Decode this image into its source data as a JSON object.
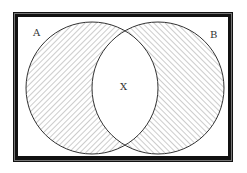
{
  "diagram": {
    "type": "venn",
    "title": "",
    "sets": [
      {
        "id": "A",
        "label": "A",
        "shaded": true,
        "hatch": "forward-diagonal"
      },
      {
        "id": "B",
        "label": "B",
        "shaded": true,
        "hatch": "back-diagonal"
      }
    ],
    "intersection": {
      "label": "X",
      "shaded": false
    },
    "colors": {
      "frame": "#111111",
      "outline": "#333333",
      "hatch": "#9a9a9a",
      "background": "#ffffff"
    }
  }
}
